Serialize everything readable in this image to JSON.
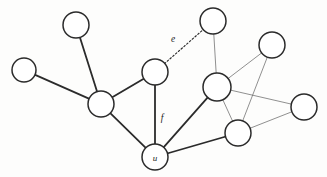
{
  "figure": {
    "type": "graph-diagram",
    "background_color": "#fdfdfc",
    "width": 327,
    "height": 177
  },
  "style": {
    "node_fill": "#ffffff",
    "node_stroke": "#2b2b2b",
    "edge_thick_color": "#2b2b2b",
    "edge_thin_color": "#6b6b6b",
    "edge_dashed_color": "#2b2b2b"
  },
  "nodes": [
    {
      "id": "n1",
      "label": "",
      "cx": 24,
      "cy": 70,
      "r": 12
    },
    {
      "id": "n2",
      "label": "",
      "cx": 76,
      "cy": 25,
      "r": 13
    },
    {
      "id": "n3",
      "label": "",
      "cx": 101,
      "cy": 104,
      "r": 13
    },
    {
      "id": "n4",
      "label": "",
      "cx": 155,
      "cy": 72,
      "r": 13
    },
    {
      "id": "n5",
      "label": "u",
      "cx": 155,
      "cy": 157,
      "r": 13
    },
    {
      "id": "n6",
      "label": "",
      "cx": 213,
      "cy": 21,
      "r": 13
    },
    {
      "id": "n7",
      "label": "",
      "cx": 217,
      "cy": 87,
      "r": 14
    },
    {
      "id": "n8",
      "label": "",
      "cx": 272,
      "cy": 45,
      "r": 13
    },
    {
      "id": "n9",
      "label": "",
      "cx": 304,
      "cy": 107,
      "r": 13
    },
    {
      "id": "n10",
      "label": "",
      "cx": 238,
      "cy": 133,
      "r": 13
    }
  ],
  "edges": [
    {
      "id": "e-n1-n3",
      "from": "n1",
      "to": "n3",
      "style": "thick",
      "label": ""
    },
    {
      "id": "e-n2-n3",
      "from": "n2",
      "to": "n3",
      "style": "thick",
      "label": ""
    },
    {
      "id": "e-n3-n4",
      "from": "n3",
      "to": "n4",
      "style": "thick",
      "label": ""
    },
    {
      "id": "e-n3-n5",
      "from": "n3",
      "to": "n5",
      "style": "thick",
      "label": ""
    },
    {
      "id": "e-n4-n5",
      "from": "n4",
      "to": "n5",
      "style": "thick",
      "label": "f"
    },
    {
      "id": "e-n5-n7",
      "from": "n5",
      "to": "n7",
      "style": "thick",
      "label": ""
    },
    {
      "id": "e-n5-n10",
      "from": "n5",
      "to": "n10",
      "style": "thick",
      "label": ""
    },
    {
      "id": "e-n6-n7",
      "from": "n6",
      "to": "n7",
      "style": "thin",
      "label": ""
    },
    {
      "id": "e-n4-n6",
      "from": "n4",
      "to": "n6",
      "style": "dashed",
      "label": "e"
    },
    {
      "id": "e-n7-n8",
      "from": "n7",
      "to": "n8",
      "style": "thin",
      "label": ""
    },
    {
      "id": "e-n7-n9",
      "from": "n7",
      "to": "n9",
      "style": "thin",
      "label": ""
    },
    {
      "id": "e-n7-n10",
      "from": "n7",
      "to": "n10",
      "style": "thin",
      "label": ""
    },
    {
      "id": "e-n8-n10",
      "from": "n8",
      "to": "n10",
      "style": "thin",
      "label": ""
    },
    {
      "id": "e-n9-n10",
      "from": "n9",
      "to": "n10",
      "style": "thin",
      "label": ""
    }
  ],
  "labels": {
    "edge_e": "e",
    "edge_f": "f",
    "node_u": "u"
  },
  "label_positions": {
    "edge_e": {
      "x": 173,
      "y": 39
    },
    "edge_f": {
      "x": 162,
      "y": 118
    }
  }
}
